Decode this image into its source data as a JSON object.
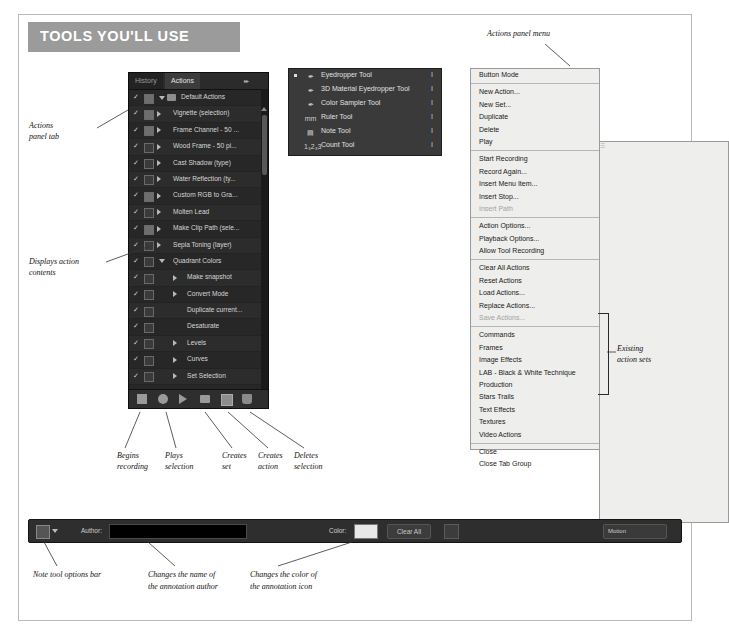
{
  "banner": {
    "title": "TOOLS YOU'LL USE"
  },
  "actions_panel": {
    "tabs": [
      {
        "label": "History",
        "active": false
      },
      {
        "label": "Actions",
        "active": true
      }
    ],
    "collapse_icon": "double-chevron-right-icon",
    "menu_icon": "panel-menu-icon",
    "rows": [
      {
        "label": "Default Actions",
        "indent": 44,
        "check": "✓",
        "box": "filled",
        "disc": "down",
        "folder": true
      },
      {
        "label": "Vignette (selection)",
        "indent": 44,
        "check": "✓",
        "box": "filled",
        "disc": "right"
      },
      {
        "label": "Frame Channel - 50 ...",
        "indent": 44,
        "check": "✓",
        "box": "filled",
        "disc": "right"
      },
      {
        "label": "Wood Frame - 50 pi...",
        "indent": 44,
        "check": "✓",
        "box": "empty",
        "disc": "right"
      },
      {
        "label": "Cast Shadow (type)",
        "indent": 44,
        "check": "✓",
        "box": "empty",
        "disc": "right"
      },
      {
        "label": "Water Reflection (ty...",
        "indent": 44,
        "check": "✓",
        "box": "empty",
        "disc": "right"
      },
      {
        "label": "Custom RGB to Gra...",
        "indent": 44,
        "check": "✓",
        "box": "filled",
        "disc": "right"
      },
      {
        "label": "Molten Lead",
        "indent": 44,
        "check": "✓",
        "box": "empty",
        "disc": "right"
      },
      {
        "label": "Make Clip Path (sele...",
        "indent": 44,
        "check": "✓",
        "box": "filled",
        "disc": "right"
      },
      {
        "label": "Sepia Toning (layer)",
        "indent": 44,
        "check": "✓",
        "box": "empty",
        "disc": "right"
      },
      {
        "label": "Quadrant Colors",
        "indent": 44,
        "check": "✓",
        "box": "empty",
        "disc": "down"
      },
      {
        "label": "Make snapshot",
        "indent": 58,
        "check": "✓",
        "box": "empty",
        "disc": "right-in"
      },
      {
        "label": "Convert Mode",
        "indent": 58,
        "check": "✓",
        "box": "empty",
        "disc": "right-in"
      },
      {
        "label": "Duplicate current...",
        "indent": 58,
        "check": "✓",
        "box": "empty",
        "disc": "none"
      },
      {
        "label": "Desaturate",
        "indent": 58,
        "check": "✓",
        "box": "empty",
        "disc": "none"
      },
      {
        "label": "Levels",
        "indent": 58,
        "check": "✓",
        "box": "empty",
        "disc": "right-in"
      },
      {
        "label": "Curves",
        "indent": 58,
        "check": "✓",
        "box": "empty",
        "disc": "right-in"
      },
      {
        "label": "Set Selection",
        "indent": 58,
        "check": "✓",
        "box": "empty",
        "disc": "right-in"
      },
      {
        "label": "Color Balance",
        "indent": 58,
        "check": "✓",
        "box": "empty",
        "disc": "right-in"
      },
      {
        "label": "Set Selection",
        "indent": 58,
        "check": "✓",
        "box": "empty",
        "disc": "right-in"
      },
      {
        "label": "Color Balance",
        "indent": 58,
        "check": "✓",
        "box": "empty",
        "disc": "right-in"
      },
      {
        "label": "Set Selection",
        "indent": 58,
        "check": "✓",
        "box": "empty",
        "disc": "right-in"
      }
    ],
    "bottom_buttons": [
      {
        "name": "stop-playing-recording-button",
        "icon": "stop-square-icon"
      },
      {
        "name": "begin-recording-button",
        "icon": "record-circle-icon"
      },
      {
        "name": "play-selection-button",
        "icon": "play-triangle-icon"
      },
      {
        "name": "create-new-set-button",
        "icon": "folder-icon"
      },
      {
        "name": "create-new-action-button",
        "icon": "new-page-icon"
      },
      {
        "name": "delete-button",
        "icon": "trash-icon"
      }
    ]
  },
  "tools_flyout": {
    "items": [
      {
        "label": "Eyedropper Tool",
        "key": "I",
        "icon": "eyedropper-icon",
        "selected": true
      },
      {
        "label": "3D Material Eyedropper Tool",
        "key": "I",
        "icon": "3d-eyedropper-icon",
        "selected": false
      },
      {
        "label": "Color Sampler Tool",
        "key": "I",
        "icon": "color-sampler-icon",
        "selected": false
      },
      {
        "label": "Ruler Tool",
        "key": "I",
        "icon": "ruler-icon",
        "selected": false
      },
      {
        "label": "Note Tool",
        "key": "I",
        "icon": "note-icon",
        "selected": false
      },
      {
        "label": "Count Tool",
        "key": "I",
        "icon": "count-123-icon",
        "selected": false
      }
    ]
  },
  "panel_menu": {
    "groups": [
      [
        {
          "label": "Button Mode",
          "disabled": false
        }
      ],
      [
        {
          "label": "New Action...",
          "disabled": false
        },
        {
          "label": "New Set...",
          "disabled": false
        },
        {
          "label": "Duplicate",
          "disabled": false
        },
        {
          "label": "Delete",
          "disabled": false
        },
        {
          "label": "Play",
          "disabled": false
        }
      ],
      [
        {
          "label": "Start Recording",
          "disabled": false
        },
        {
          "label": "Record Again...",
          "disabled": false
        },
        {
          "label": "Insert Menu Item...",
          "disabled": false
        },
        {
          "label": "Insert Stop...",
          "disabled": false
        },
        {
          "label": "Insert Path",
          "disabled": true
        }
      ],
      [
        {
          "label": "Action Options...",
          "disabled": false
        },
        {
          "label": "Playback Options...",
          "disabled": false
        },
        {
          "label": "Allow Tool Recording",
          "disabled": false
        }
      ],
      [
        {
          "label": "Clear All Actions",
          "disabled": false
        },
        {
          "label": "Reset Actions",
          "disabled": false
        },
        {
          "label": "Load Actions...",
          "disabled": false
        },
        {
          "label": "Replace Actions...",
          "disabled": false
        },
        {
          "label": "Save Actions...",
          "disabled": true
        }
      ],
      [
        {
          "label": "Commands",
          "disabled": false
        },
        {
          "label": "Frames",
          "disabled": false
        },
        {
          "label": "Image Effects",
          "disabled": false
        },
        {
          "label": "LAB - Black & White Technique",
          "disabled": false
        },
        {
          "label": "Production",
          "disabled": false
        },
        {
          "label": "Stars Trails",
          "disabled": false
        },
        {
          "label": "Text Effects",
          "disabled": false
        },
        {
          "label": "Textures",
          "disabled": false
        },
        {
          "label": "Video Actions",
          "disabled": false
        }
      ],
      [
        {
          "label": "Close",
          "disabled": false
        },
        {
          "label": "Close Tab Group",
          "disabled": false
        }
      ]
    ]
  },
  "options_bar": {
    "tool_preset_icon": "note-tool-preset-icon",
    "author_label": "Author:",
    "author_value": "",
    "color_label": "Color:",
    "color_value": "#e8e8e8",
    "clear_all_label": "Clear All",
    "toggle_panel_icon": "toggle-notes-panel-icon",
    "workspace_label": "Motion"
  },
  "callouts": {
    "actions_panel_menu": "Actions panel menu",
    "actions_panel_tab": "Actions\npanel tab",
    "actions_panel_tab_l1": "Actions",
    "actions_panel_tab_l2": "panel tab",
    "displays_action_l1": "Displays action",
    "displays_action_l2": "contents",
    "existing_sets_l1": "Existing",
    "existing_sets_l2": "action sets",
    "begins_recording_l1": "Begins",
    "begins_recording_l2": "recording",
    "plays_selection_l1": "Plays",
    "plays_selection_l2": "selection",
    "creates_set_l1": "Creates",
    "creates_set_l2": "set",
    "creates_action_l1": "Creates",
    "creates_action_l2": "action",
    "deletes_selection_l1": "Deletes",
    "deletes_selection_l2": "selection",
    "note_tool_options_bar": "Note tool options bar",
    "changes_author_l1": "Changes the name of",
    "changes_author_l2": "the annotation author",
    "changes_color_l1": "Changes the color of",
    "changes_color_l2": "the annotation icon"
  },
  "colors": {
    "banner_bg": "#9b9b9b",
    "panel_bg": "#1d1d1d",
    "menu_bg": "#eeeeec",
    "frame_border": "#b9b9b9"
  }
}
